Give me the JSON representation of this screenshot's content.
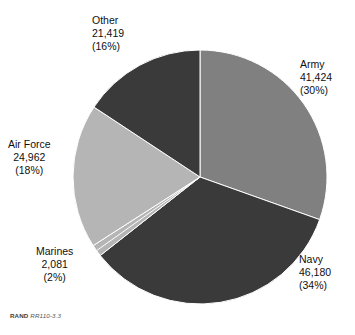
{
  "figure": {
    "source_note": {
      "organization": "RAND",
      "identifier": "RR110-3.3"
    }
  },
  "chart_data": {
    "type": "pie",
    "title": "",
    "subtitle": "",
    "xlabel": "",
    "ylabel": "",
    "legend_position": "none",
    "grid": false,
    "start_angle_deg": 0,
    "direction": "clockwise",
    "total": 136066,
    "categories": [
      "Army",
      "Navy",
      "Marines",
      "Air Force",
      "Other"
    ],
    "values": [
      41424,
      46180,
      2081,
      24962,
      21419
    ],
    "percentages": [
      30,
      34,
      2,
      18,
      16
    ],
    "colors": [
      "#808080",
      "#3a3a3a",
      "#b5b5b5",
      "#b5b5b5",
      "#3a3a3a"
    ],
    "slices": [
      {
        "name": "Army",
        "value": 41424,
        "value_label": "41,424",
        "percent": 30,
        "percent_label": "(30%)",
        "color": "#808080",
        "start_deg": 0,
        "end_deg": 109.6
      },
      {
        "name": "Navy",
        "value": 46180,
        "value_label": "46,180",
        "percent": 34,
        "percent_label": "(34%)",
        "color": "#3a3a3a",
        "start_deg": 109.6,
        "end_deg": 231.8
      },
      {
        "name": "Marines",
        "value": 2081,
        "value_label": "2,081",
        "percent": 2,
        "percent_label": "(2%)",
        "color": "#b5b5b5",
        "start_deg": 231.8,
        "end_deg": 237.3
      },
      {
        "name": "Air Force",
        "value": 24962,
        "value_label": "24,962",
        "percent": 18,
        "percent_label": "(18%)",
        "color": "#b5b5b5",
        "start_deg": 237.3,
        "end_deg": 303.4
      },
      {
        "name": "Other",
        "value": 21419,
        "value_label": "21,419",
        "percent": 16,
        "percent_label": "(16%)",
        "color": "#3a3a3a",
        "start_deg": 303.4,
        "end_deg": 360
      }
    ]
  },
  "labels": {
    "army": {
      "name": "Army",
      "value": "41,424",
      "pct": "(30%)"
    },
    "navy": {
      "name": "Navy",
      "value": "46,180",
      "pct": "(34%)"
    },
    "marines": {
      "name": "Marines",
      "value": "2,081",
      "pct": "(2%)"
    },
    "air_force": {
      "name": "Air Force",
      "value": "24,962",
      "pct": "(18%)"
    },
    "other": {
      "name": "Other",
      "value": "21,419",
      "pct": "(16%)"
    }
  }
}
